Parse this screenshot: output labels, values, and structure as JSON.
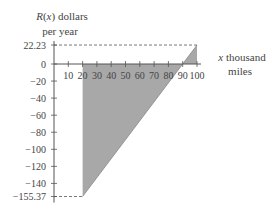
{
  "chart_data": {
    "type": "area",
    "title": "",
    "ylabel_line1": "R(x) dollars",
    "ylabel_line2": "per year",
    "xlabel_line1": "x thousand",
    "xlabel_line2": "miles",
    "x_ticks": [
      10,
      20,
      30,
      40,
      50,
      60,
      70,
      80,
      90,
      100
    ],
    "x_tick_labels": [
      "10",
      "20",
      "30",
      "40",
      "50",
      "60",
      "70",
      "80",
      "90",
      "100"
    ],
    "y_ticks": [
      22.23,
      0,
      -20,
      -40,
      -60,
      -80,
      -100,
      -120,
      -140,
      -155.37
    ],
    "y_tick_labels": [
      "22.23",
      "0",
      "−20",
      "−40",
      "−60",
      "−80",
      "−100",
      "−120",
      "−140",
      "−155.37"
    ],
    "xlim": [
      0,
      100
    ],
    "ylim": [
      -155.37,
      22.23
    ],
    "series": [
      {
        "name": "R(x)",
        "x": [
          20,
          100
        ],
        "y": [
          -155.37,
          22.23
        ],
        "shaded_to_axis": true
      }
    ],
    "annotations": [
      {
        "type": "dashed-line",
        "y": 22.23,
        "from_x": 0,
        "to_x": 100
      },
      {
        "type": "dashed-line",
        "y": -155.37,
        "from_x": 0,
        "to_x": 20
      }
    ],
    "grid": false,
    "fill_color": "#a8a8a8"
  }
}
